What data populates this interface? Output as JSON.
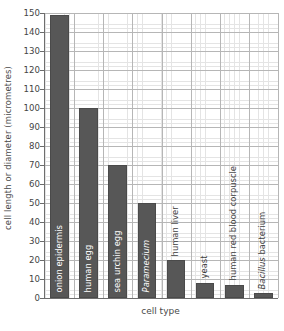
{
  "chart_data": {
    "type": "bar",
    "title": "",
    "xlabel": "cell type",
    "ylabel": "cell length or diameter (micrometres)",
    "ylim": [
      0,
      150
    ],
    "ytick_step": 10,
    "yticks": [
      150,
      140,
      130,
      120,
      110,
      100,
      90,
      80,
      70,
      60,
      50,
      40,
      30,
      20,
      10,
      0
    ],
    "grid": "major and minor gridlines",
    "legend": "none",
    "bar_color": "#575757",
    "categories": [
      "onion epidermis",
      "human egg",
      "sea urchin egg",
      "Paramecium",
      "human liver",
      "yeast",
      "human red blood corpuscle",
      "Bacillus bacterium"
    ],
    "values": [
      149,
      100,
      70,
      50,
      20,
      8,
      7,
      2.5
    ],
    "bars": [
      {
        "label": "onion epidermis",
        "value": 149,
        "label_style": "inside",
        "italic": false
      },
      {
        "label": "human egg",
        "value": 100,
        "label_style": "inside",
        "italic": false
      },
      {
        "label": "sea urchin egg",
        "value": 70,
        "label_style": "inside",
        "italic": false
      },
      {
        "label": "Paramecium",
        "value": 50,
        "label_style": "inside",
        "italic": true
      },
      {
        "label": "human liver",
        "value": 20,
        "label_style": "outside",
        "italic": false
      },
      {
        "label": "yeast",
        "value": 8,
        "label_style": "outside",
        "italic": false
      },
      {
        "label": "human red blood corpuscle",
        "value": 7,
        "label_style": "outside",
        "italic": false
      },
      {
        "label": "Bacillus bacterium",
        "value": 2.5,
        "label_style": "outside",
        "italic": "partial"
      }
    ]
  }
}
